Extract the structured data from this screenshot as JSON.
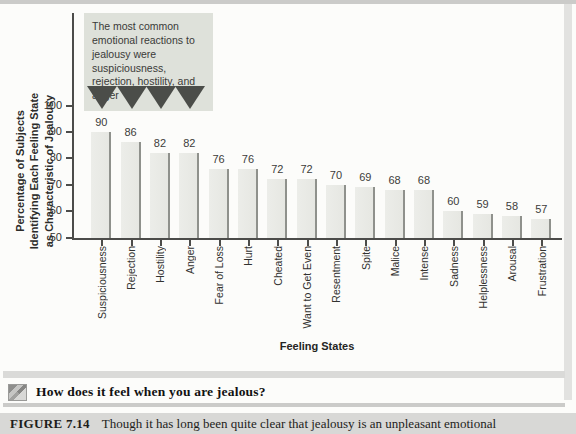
{
  "chart_data": {
    "type": "bar",
    "categories": [
      "Suspiciousness",
      "Rejection",
      "Hostility",
      "Anger",
      "Fear of Loss",
      "Hurt",
      "Cheated",
      "Want to Get Even",
      "Resentment",
      "Spite",
      "Malice",
      "Intense",
      "Sadness",
      "Helplessness",
      "Arousal",
      "Frustration"
    ],
    "values": [
      90,
      86,
      82,
      82,
      76,
      76,
      72,
      72,
      70,
      69,
      68,
      68,
      60,
      59,
      58,
      57
    ],
    "title": "",
    "xlabel": "Feeling States",
    "ylabel": "Percentage of Subjects Identifying Each Feeling State as Characteristic of Jealousy",
    "ylabel_lines": [
      "Percentage of Subjects",
      "Identifying Each Feeling State",
      "as Characteristic of Jealousy"
    ],
    "ylim": [
      50,
      100
    ],
    "yticks": [
      50,
      60,
      70,
      80,
      90,
      100
    ],
    "grid": false,
    "legend": "none",
    "bar_color": "#ecede9",
    "bar_edge_color": "#8f918c",
    "annotation": {
      "text": "The most common emotional reactions to jealousy were suspiciousness, rejection, hostility, and anger",
      "arrow_count": 4,
      "box_color": "#dee1da",
      "arrow_color": "#4b4d49"
    }
  },
  "question": {
    "icon": "photo-thumbnail-icon",
    "label": "How does it feel when you are jealous?"
  },
  "caption": {
    "figure_label": "FIGURE 7.14",
    "text": "Though it has long been quite clear that jealousy is an unpleasant emotional"
  },
  "colors": {
    "axis": "#4c4c4a",
    "page_background": "#fcfcfa",
    "caption_bar": "#d8d8d6",
    "divider": "#dadad8"
  }
}
